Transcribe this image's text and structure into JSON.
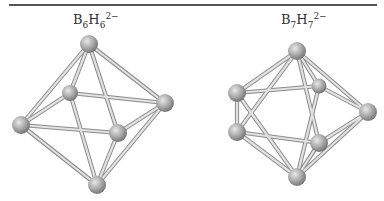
{
  "figure": {
    "left": {
      "formula": {
        "b": "B",
        "b_sub": "6",
        "h": "H",
        "h_sub": "6",
        "charge": "2−"
      },
      "shape": "octahedron"
    },
    "right": {
      "formula": {
        "b": "B",
        "b_sub": "7",
        "h": "H",
        "h_sub": "7",
        "charge": "2−"
      },
      "shape": "pentagonal bipyramid"
    }
  },
  "colors": {
    "ball": "#a9a9a9",
    "bond": "#d8d8d8",
    "bond_edge": "#8a8a8a",
    "rule": "#555555"
  }
}
